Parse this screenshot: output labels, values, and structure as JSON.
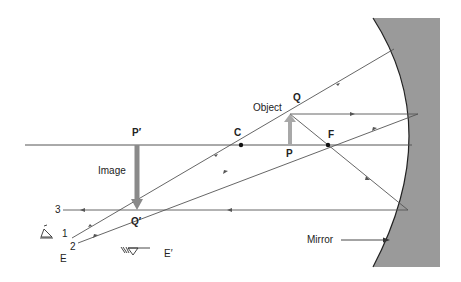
{
  "diagram": {
    "type": "ray-diagram",
    "colors": {
      "mirror_fill": "#9a9a9a",
      "mirror_edge": "#222222",
      "ray": "#555555",
      "axis": "#555555",
      "object_arrow": "#a8a8a8",
      "image_arrow": "#8a8a8a",
      "text": "#222222"
    },
    "labels": {
      "object": "Object",
      "image": "Image",
      "mirror": "Mirror",
      "Q": "Q",
      "P": "P",
      "P_prime": "P′",
      "Q_prime": "Q′",
      "C": "C",
      "F": "F",
      "E": "E",
      "E_prime": "E′",
      "ray1": "1",
      "ray2": "2",
      "ray3": "3"
    },
    "points": {
      "C": [
        241,
        145
      ],
      "F": [
        328,
        145
      ],
      "P": [
        290,
        145
      ],
      "Q": [
        290,
        114
      ],
      "P_prime": [
        137,
        145
      ],
      "Q_prime": [
        137,
        210
      ]
    }
  }
}
